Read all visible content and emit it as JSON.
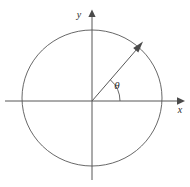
{
  "figure": {
    "type": "geometry-diagram",
    "background_color": "#ffffff",
    "stroke_color": "#575757",
    "label_color": "#2b2b2b",
    "width": 190,
    "height": 187
  },
  "axes": {
    "origin": {
      "x": 92,
      "y": 101
    },
    "x_axis": {
      "label": "x",
      "label_position": {
        "x": 180,
        "y": 113
      },
      "start": {
        "x": 5,
        "y": 101
      },
      "end": {
        "x": 178,
        "y": 101
      },
      "arrow_tip": {
        "x": 184,
        "y": 101
      },
      "arrow_direction": "right"
    },
    "y_axis": {
      "label": "y",
      "label_position": {
        "x": 79,
        "y": 18
      },
      "start": {
        "x": 92,
        "y": 180
      },
      "end": {
        "x": 92,
        "y": 16
      },
      "arrow_tip": {
        "x": 92,
        "y": 10
      },
      "arrow_direction": "up"
    }
  },
  "circle": {
    "name": "unit-circle",
    "center": {
      "x": 92,
      "y": 98
    },
    "radius_x": 70,
    "radius_y": 68
  },
  "ray": {
    "name": "terminal-ray",
    "from": {
      "x": 92,
      "y": 101
    },
    "to": {
      "x": 138,
      "y": 48
    },
    "arrow_tip": {
      "x": 143,
      "y": 42
    },
    "angle_degrees": 49
  },
  "angle": {
    "symbol": "θ",
    "label": "θ",
    "label_position": {
      "x": 117,
      "y": 89
    },
    "arc_radius": 28,
    "arc_start_degrees": 0,
    "arc_end_degrees": 49,
    "measured_from": "positive x-axis"
  }
}
